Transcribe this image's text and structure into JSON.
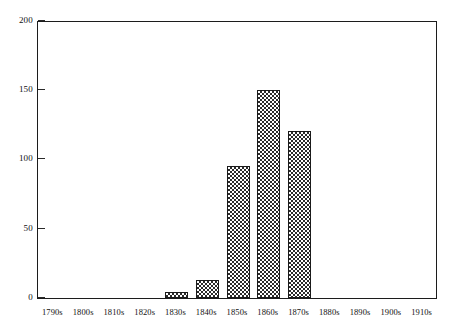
{
  "chart_data": {
    "type": "bar",
    "title": "",
    "subtitle": "",
    "xlabel": "",
    "ylabel": "",
    "categories": [
      "1790s",
      "1800s",
      "1810s",
      "1820s",
      "1830s",
      "1840s",
      "1850s",
      "1860s",
      "1870s",
      "1880s",
      "1890s",
      "1900s",
      "1910s"
    ],
    "values": [
      0,
      0,
      0,
      0,
      4,
      13,
      95,
      150,
      120,
      0,
      0,
      0,
      0
    ],
    "ylim": [
      0,
      200
    ],
    "yticks": [
      0,
      50,
      100,
      150,
      200
    ],
    "ytick_labels": [
      "0",
      "50",
      "100",
      "150",
      "200"
    ],
    "grid": false,
    "legend": null,
    "legend_position": "none",
    "bar_fill": "checkerboard",
    "bar_color": "#2b2b2b",
    "frame_color": "#1c1c1c",
    "background": "#ffffff",
    "annotations": []
  }
}
